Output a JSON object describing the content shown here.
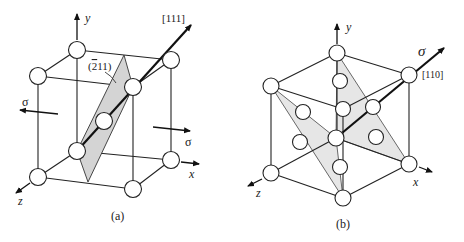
{
  "figure": {
    "panels": [
      {
        "id": "a",
        "caption": "(a)",
        "structure": "body-centered cubic unit cell",
        "axes": {
          "x": "x",
          "y": "y",
          "z": "z"
        },
        "plane_label": "(̅2̅ 11)",
        "plane_label_text": "(",
        "plane_label_bar_digit": "2",
        "plane_label_rest": "11)",
        "direction_label": "[111]",
        "stress_label_left": "σ",
        "stress_label_right": "σ"
      },
      {
        "id": "b",
        "caption": "(b)",
        "structure": "face-centered cubic unit cell",
        "axes": {
          "x": "x",
          "y": "y",
          "z": "z"
        },
        "direction_label": "[110]",
        "stress_label": "σ"
      }
    ]
  }
}
